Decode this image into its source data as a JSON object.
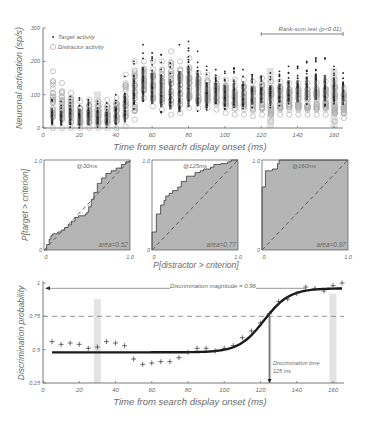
{
  "colors": {
    "axis": "#555555",
    "tick_text": "#8a8a8a",
    "label_text": "#6a6a6a",
    "target_dot": "#222222",
    "distractor_circle": "#b0b0b0",
    "roc_fill": "#b5b5b5",
    "shade": "#c8c8c8",
    "fit_line": "#1a1a1a"
  },
  "chart_data": [
    {
      "id": "panel-a",
      "type": "scatter",
      "title": "",
      "xlabel": "Time from search display onset (ms)",
      "ylabel": "Neuronal activation (sp/s)",
      "xlim": [
        0,
        165
      ],
      "ylim": [
        0,
        300
      ],
      "xticks": [
        "0",
        "20",
        "40",
        "60",
        "80",
        "100",
        "120",
        "140",
        "160"
      ],
      "yticks": [
        "0",
        "100",
        "200",
        "300"
      ],
      "legend": [
        {
          "label": "Target activity",
          "marker": "dot"
        },
        {
          "label": "Distractor activity",
          "marker": "circle"
        }
      ],
      "annotation": {
        "text": "Rank-sum test (p<0.01)",
        "x_from": 120,
        "x_to": 165
      },
      "highlight_times": [
        30,
        125,
        160
      ],
      "x": [
        5,
        10,
        15,
        20,
        25,
        30,
        35,
        40,
        45,
        50,
        55,
        60,
        65,
        70,
        75,
        80,
        85,
        90,
        95,
        100,
        105,
        110,
        115,
        120,
        125,
        130,
        135,
        140,
        145,
        150,
        155,
        160,
        165
      ],
      "series": [
        {
          "name": "Target activity (range sp/s)",
          "min": [
            0,
            0,
            0,
            0,
            0,
            0,
            0,
            0,
            5,
            55,
            60,
            55,
            45,
            40,
            25,
            40,
            50,
            45,
            60,
            55,
            55,
            55,
            60,
            65,
            60,
            65,
            65,
            65,
            70,
            70,
            65,
            70,
            70
          ],
          "max": [
            85,
            80,
            95,
            90,
            85,
            80,
            75,
            100,
            155,
            200,
            250,
            225,
            220,
            195,
            250,
            260,
            230,
            185,
            175,
            170,
            180,
            175,
            160,
            155,
            165,
            170,
            185,
            185,
            200,
            210,
            210,
            185,
            165
          ]
        },
        {
          "name": "Distractor activity (range sp/s)",
          "min": [
            0,
            0,
            0,
            0,
            0,
            0,
            0,
            0,
            5,
            25,
            90,
            65,
            55,
            40,
            45,
            60,
            60,
            60,
            55,
            45,
            40,
            40,
            35,
            40,
            20,
            40,
            40,
            40,
            40,
            40,
            40,
            20,
            30
          ],
          "max": [
            170,
            135,
            105,
            80,
            85,
            80,
            85,
            90,
            160,
            200,
            200,
            200,
            200,
            230,
            200,
            210,
            165,
            160,
            150,
            145,
            145,
            145,
            140,
            150,
            140,
            140,
            135,
            135,
            135,
            135,
            140,
            145,
            120
          ]
        }
      ]
    },
    {
      "id": "panel-b1",
      "type": "line",
      "subtitle": "@30ms",
      "area_label": "area=0.52",
      "xlabel": "P[distractor > criterion]",
      "ylabel": "P[target > criterion]",
      "xlim": [
        0,
        1
      ],
      "ylim": [
        0,
        1
      ],
      "xticks": [
        "0",
        "1.0"
      ],
      "yticks": [
        "0",
        "1.0"
      ],
      "roc_x": [
        0,
        0.03,
        0.06,
        0.08,
        0.1,
        0.13,
        0.16,
        0.2,
        0.24,
        0.28,
        0.32,
        0.36,
        0.4,
        0.44,
        0.48,
        0.5,
        0.52,
        0.55,
        0.58,
        0.62,
        0.67,
        0.72,
        0.78,
        0.84,
        0.9,
        0.95,
        1.0
      ],
      "roc_y": [
        0,
        0.06,
        0.12,
        0.16,
        0.18,
        0.18,
        0.2,
        0.22,
        0.25,
        0.28,
        0.32,
        0.36,
        0.38,
        0.38,
        0.4,
        0.42,
        0.48,
        0.56,
        0.64,
        0.74,
        0.8,
        0.85,
        0.88,
        0.91,
        0.95,
        0.98,
        1.0
      ],
      "area": 0.52
    },
    {
      "id": "panel-b2",
      "type": "line",
      "subtitle": "@125ms",
      "area_label": "area=0.77",
      "xlim": [
        0,
        1
      ],
      "ylim": [
        0,
        1
      ],
      "xticks": [
        "0",
        "1.0"
      ],
      "yticks": [
        "0",
        "1.0"
      ],
      "roc_x": [
        0,
        0,
        0.05,
        0.05,
        0.1,
        0.1,
        0.14,
        0.16,
        0.2,
        0.24,
        0.3,
        0.34,
        0.38,
        0.4,
        0.46,
        0.5,
        0.56,
        0.6,
        0.68,
        0.72,
        0.8,
        0.88,
        0.92,
        1.0
      ],
      "roc_y": [
        0,
        0.2,
        0.22,
        0.4,
        0.4,
        0.5,
        0.55,
        0.6,
        0.63,
        0.66,
        0.7,
        0.76,
        0.76,
        0.82,
        0.82,
        0.86,
        0.88,
        0.9,
        0.92,
        0.95,
        0.96,
        0.98,
        1.0,
        1.0
      ],
      "area": 0.77
    },
    {
      "id": "panel-b3",
      "type": "line",
      "subtitle": "@160ms",
      "area_label": "area=0.97",
      "xlim": [
        0,
        1
      ],
      "ylim": [
        0,
        1
      ],
      "xticks": [
        "0",
        "1.0"
      ],
      "yticks": [
        "0",
        "1.0"
      ],
      "roc_x": [
        0,
        0,
        0.04,
        0.04,
        0.1,
        0.12,
        0.18,
        0.2,
        1.0
      ],
      "roc_y": [
        0,
        0.7,
        0.72,
        0.88,
        0.88,
        0.9,
        0.96,
        1.0,
        1.0
      ],
      "area": 0.97
    },
    {
      "id": "panel-c",
      "type": "line",
      "xlabel": "Time from search display onset (ms)",
      "ylabel": "Discrimination probability",
      "xlim": [
        0,
        165
      ],
      "ylim": [
        0.25,
        1.0
      ],
      "xticks": [
        "0",
        "20",
        "40",
        "60",
        "80",
        "100",
        "120",
        "140",
        "160"
      ],
      "yticks": [
        "0.25",
        "0.5",
        "0.75",
        "1"
      ],
      "threshold": 0.75,
      "magnitude_label": "Discrimination magnitude = 0.96",
      "magnitude": 0.96,
      "time_label_line1": "Discrimination time",
      "time_label_line2": "125 ms",
      "discrimination_time": 125,
      "highlight_times": [
        30,
        160
      ],
      "x": [
        5,
        10,
        15,
        20,
        25,
        30,
        35,
        40,
        45,
        50,
        55,
        60,
        65,
        70,
        75,
        80,
        85,
        90,
        95,
        100,
        105,
        110,
        115,
        120,
        125,
        130,
        135,
        140,
        145,
        150,
        155,
        160,
        165
      ],
      "values": [
        0.56,
        0.54,
        0.55,
        0.54,
        0.51,
        0.52,
        0.56,
        0.55,
        0.53,
        0.43,
        0.39,
        0.4,
        0.41,
        0.41,
        0.44,
        0.48,
        0.51,
        0.51,
        0.49,
        0.51,
        0.53,
        0.59,
        0.64,
        0.7,
        0.77,
        0.86,
        0.88,
        0.92,
        0.97,
        0.96,
        0.94,
        0.98,
        1.0
      ],
      "fit": {
        "type": "weibull",
        "baseline": 0.48,
        "max": 0.96,
        "midpoint": 122
      }
    }
  ]
}
